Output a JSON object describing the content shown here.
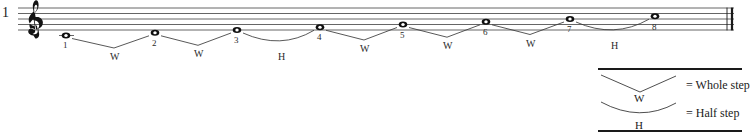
{
  "score": {
    "measure_number": "1",
    "clef": "treble-clef",
    "barline": "final-double-barline",
    "staff": {
      "lines": 5,
      "top_y": 8,
      "line_spacing": 5.5,
      "left_x": 18,
      "right_x": 734
    },
    "notes": [
      {
        "label": "1",
        "x": 66,
        "y": 30,
        "ledger": true,
        "pitch_step": 0
      },
      {
        "label": "2",
        "x": 155,
        "y": 27.5,
        "ledger": false,
        "pitch_step": 1
      },
      {
        "label": "3",
        "x": 237,
        "y": 25,
        "ledger": false,
        "pitch_step": 2
      },
      {
        "label": "4",
        "x": 320,
        "y": 22.5,
        "ledger": false,
        "pitch_step": 3
      },
      {
        "label": "5",
        "x": 403,
        "y": 20,
        "ledger": false,
        "pitch_step": 4
      },
      {
        "label": "6",
        "x": 486,
        "y": 17.5,
        "ledger": false,
        "pitch_step": 5
      },
      {
        "label": "7",
        "x": 570,
        "y": 15,
        "ledger": false,
        "pitch_step": 6
      },
      {
        "label": "8",
        "x": 655,
        "y": 12.5,
        "ledger": false,
        "pitch_step": 7
      }
    ],
    "intervals": [
      {
        "letter": "W",
        "shape": "vee",
        "from": "1",
        "to": "2",
        "mid_x": 114
      },
      {
        "letter": "W",
        "shape": "vee",
        "from": "2",
        "to": "3",
        "mid_x": 198
      },
      {
        "letter": "H",
        "shape": "curve",
        "from": "3",
        "to": "4",
        "mid_x": 281
      },
      {
        "letter": "W",
        "shape": "vee",
        "from": "4",
        "to": "5",
        "mid_x": 364
      },
      {
        "letter": "W",
        "shape": "vee",
        "from": "5",
        "to": "6",
        "mid_x": 447
      },
      {
        "letter": "W",
        "shape": "vee",
        "from": "6",
        "to": "7",
        "mid_x": 530
      },
      {
        "letter": "H",
        "shape": "curve",
        "from": "7",
        "to": "8",
        "mid_x": 614
      }
    ]
  },
  "legend": {
    "whole": {
      "letter": "W",
      "label": "= Whole step",
      "shape": "vee"
    },
    "half": {
      "letter": "H",
      "label": "= Half step",
      "shape": "curve"
    },
    "rule_color": "#1a1a1a",
    "box": {
      "x": 596,
      "y": 66,
      "width": 148,
      "height": 66
    }
  },
  "colors": {
    "ink": "#1a1a1a",
    "staff_line": "#555555",
    "bracket": "#3a3a3a",
    "background": "#ffffff"
  }
}
